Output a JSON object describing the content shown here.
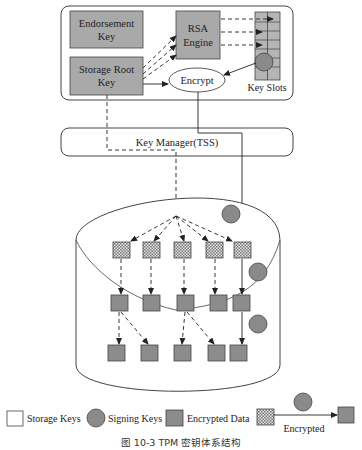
{
  "tpm_chip": {
    "endorsement_key": {
      "line1": "Endorsement",
      "line2": "Key"
    },
    "storage_root_key": {
      "line1": "Storage Root",
      "line2": "Key"
    },
    "rsa_engine": {
      "line1": "RSA",
      "line2": "Engine"
    },
    "encrypt": "Encrypt",
    "key_slots": "Key Slots"
  },
  "key_manager": "Key Manager(TSS)",
  "legend": {
    "storage_keys": "Storage Keys",
    "signing_keys": "Signing Keys",
    "encrypted_data": "Encrypted Data",
    "encrypted": "Encrypted"
  },
  "caption": "图 10-3   TPM 密钥体系结构",
  "colors": {
    "box_fill": "#a9a9a9",
    "circle_fill": "#8a8a8a",
    "square_fill": "#8c8c8c",
    "line": "#333333"
  }
}
